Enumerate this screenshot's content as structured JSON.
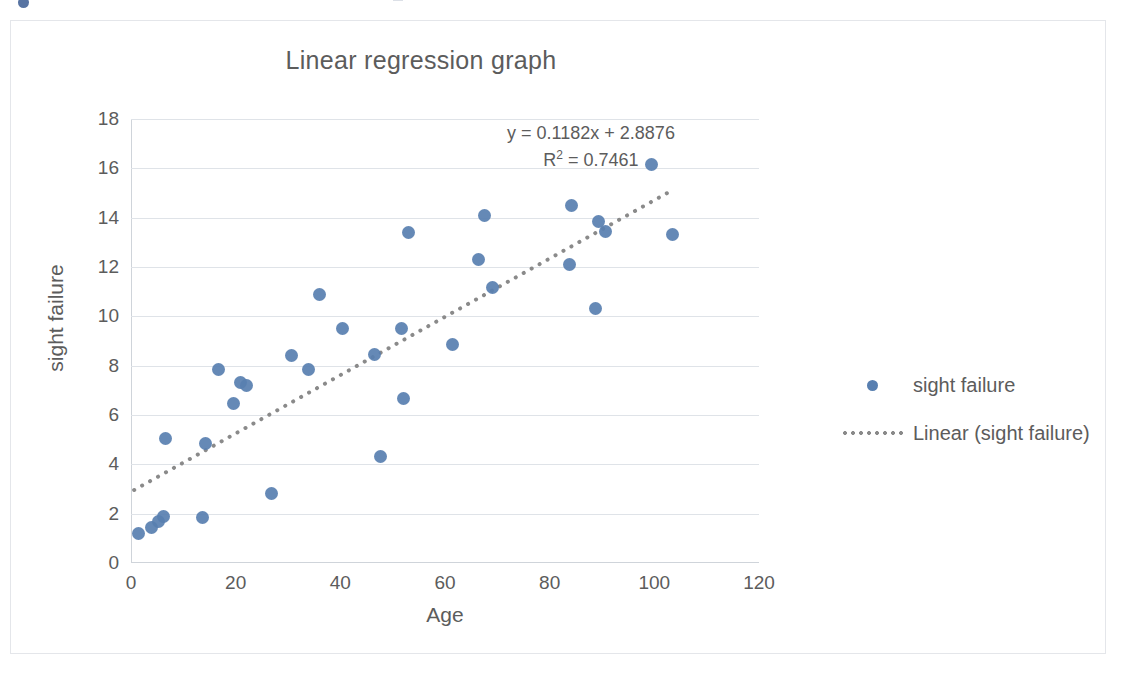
{
  "chart_data": {
    "type": "scatter",
    "title": "Linear regression graph",
    "xlabel": "Age",
    "ylabel": "sight failure",
    "xlim": [
      0,
      120
    ],
    "ylim": [
      0,
      18
    ],
    "xticks": [
      0,
      20,
      40,
      60,
      80,
      100,
      120
    ],
    "yticks": [
      0,
      2,
      4,
      6,
      8,
      10,
      12,
      14,
      16,
      18
    ],
    "grid": "horizontal",
    "legend_position": "right",
    "marker_color": "#587fb0",
    "trendline_color": "#8a8a8a",
    "series": [
      {
        "name": "sight failure",
        "type": "scatter",
        "points": [
          [
            1.5,
            1.2
          ],
          [
            4.0,
            1.45
          ],
          [
            5.2,
            1.7
          ],
          [
            6.2,
            1.9
          ],
          [
            6.6,
            5.05
          ],
          [
            13.6,
            1.85
          ],
          [
            14.2,
            4.85
          ],
          [
            16.8,
            7.85
          ],
          [
            19.6,
            6.45
          ],
          [
            21.0,
            7.3
          ],
          [
            22.0,
            7.2
          ],
          [
            26.8,
            2.8
          ],
          [
            30.6,
            8.4
          ],
          [
            34.0,
            7.85
          ],
          [
            36.0,
            10.9
          ],
          [
            40.4,
            9.5
          ],
          [
            46.6,
            8.45
          ],
          [
            47.6,
            4.3
          ],
          [
            51.6,
            9.5
          ],
          [
            52.0,
            6.65
          ],
          [
            53.0,
            13.4
          ],
          [
            61.4,
            8.85
          ],
          [
            66.4,
            12.3
          ],
          [
            67.6,
            14.1
          ],
          [
            69.0,
            11.15
          ],
          [
            83.8,
            12.1
          ],
          [
            84.2,
            14.5
          ],
          [
            88.8,
            10.3
          ],
          [
            89.4,
            13.85
          ],
          [
            90.6,
            13.45
          ],
          [
            99.4,
            16.15
          ],
          [
            103.4,
            13.3
          ]
        ]
      },
      {
        "name": "Linear (sight failure)",
        "type": "line",
        "style": "dotted",
        "slope": 0.1182,
        "intercept": 2.8876,
        "r_squared": 0.7461,
        "x_start": 0.6,
        "x_end": 102.5
      }
    ],
    "annotations": {
      "equation": "y = 0.1182x  + 2.8876",
      "r2_prefix": "R",
      "r2_exponent": "2",
      "r2_value": " = 0.7461"
    }
  },
  "legend": {
    "items": [
      {
        "key": "marker-dot",
        "label": "sight failure"
      },
      {
        "key": "dotted-line",
        "label": "Linear (sight failure)"
      }
    ]
  }
}
